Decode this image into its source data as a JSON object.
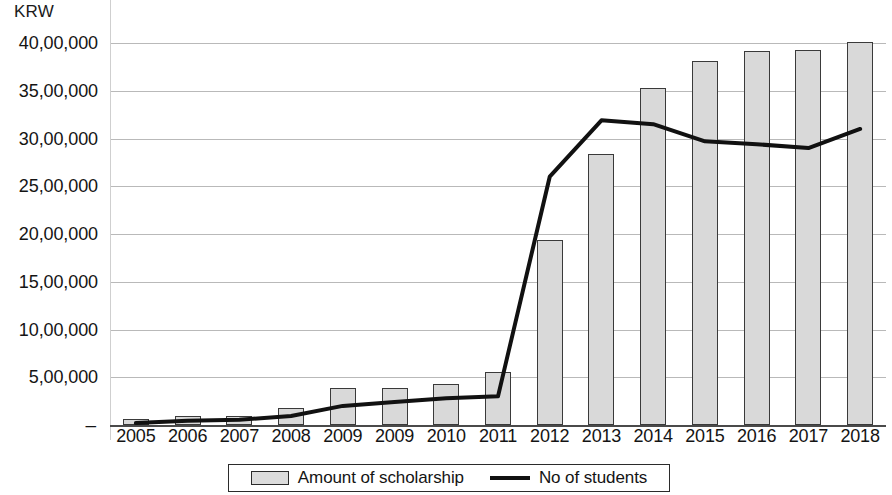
{
  "chart_data": {
    "type": "bar",
    "title": "",
    "subtitle": "",
    "unit_label": "KRW",
    "xlabel": "",
    "ylabel": "KRW",
    "grid": true,
    "legend_position": "bottom",
    "ylim": [
      0,
      4000000
    ],
    "y_ticks": [
      {
        "value": 4000000,
        "label": "40,00,000"
      },
      {
        "value": 3500000,
        "label": "35,00,000"
      },
      {
        "value": 3000000,
        "label": "30,00,000"
      },
      {
        "value": 2500000,
        "label": "25,00,000"
      },
      {
        "value": 2000000,
        "label": "20,00,000"
      },
      {
        "value": 1500000,
        "label": "15,00,000"
      },
      {
        "value": 1000000,
        "label": "10,00,000"
      },
      {
        "value": 500000,
        "label": "5,00,000"
      },
      {
        "value": 0,
        "label": "–"
      }
    ],
    "categories": [
      "2005",
      "2006",
      "2007",
      "2008",
      "2009",
      "2009",
      "2010",
      "2011",
      "2012",
      "2013",
      "2014",
      "2015",
      "2016",
      "2017",
      "2018"
    ],
    "series": [
      {
        "name": "Amount of scholarship",
        "type": "bar",
        "color": "#d9d9d9",
        "border_color": "#3a3a3a",
        "values": [
          60000,
          95000,
          95000,
          180000,
          390000,
          390000,
          430000,
          560000,
          1940000,
          2840000,
          3530000,
          3810000,
          3920000,
          3930000,
          4010000
        ]
      },
      {
        "name": "No of students",
        "type": "line",
        "color": "#111111",
        "values": [
          20000,
          45000,
          55000,
          95000,
          200000,
          240000,
          280000,
          300000,
          2600000,
          3190000,
          3150000,
          2970000,
          2940000,
          2900000,
          3100000
        ]
      }
    ]
  },
  "legend": {
    "items": [
      {
        "label": "Amount of scholarship",
        "marker": "bar-swatch"
      },
      {
        "label": "No of students",
        "marker": "line-swatch"
      }
    ]
  }
}
